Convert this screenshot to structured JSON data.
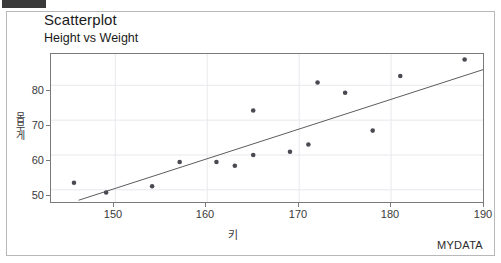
{
  "window": {
    "titlebar_stub": "",
    "footnote": "MYDATA"
  },
  "header": {
    "title": "Scatterplot",
    "subtitle": "Height vs Weight"
  },
  "axes": {
    "x_label": "키",
    "y_label": "몸무게",
    "x_ticks": [
      "150",
      "160",
      "170",
      "180",
      "190"
    ],
    "y_ticks": [
      "50",
      "60",
      "70",
      "80"
    ]
  },
  "colors": {
    "point": "#4a4a52",
    "line": "#5a5a5a",
    "frame": "#7a7a7a",
    "grid": "#e8e8ee",
    "text": "#2b2b2b",
    "panel_border": "#b8b8b8"
  },
  "chart_data": {
    "type": "scatter",
    "title": "Scatterplot",
    "subtitle": "Height vs Weight",
    "xlabel": "키",
    "ylabel": "몸무게",
    "xlim": [
      143,
      190
    ],
    "ylim": [
      46.5,
      89
    ],
    "xticks": [
      150,
      160,
      170,
      180,
      190
    ],
    "yticks": [
      50,
      60,
      70,
      80
    ],
    "grid": true,
    "legend": null,
    "annotations": [
      "MYDATA"
    ],
    "series": [
      {
        "name": "observations",
        "marker": "filled-circle",
        "points": [
          {
            "x": 145.5,
            "y": 52.0
          },
          {
            "x": 149.0,
            "y": 49.2
          },
          {
            "x": 154.0,
            "y": 51.0
          },
          {
            "x": 157.0,
            "y": 58.0
          },
          {
            "x": 161.0,
            "y": 58.0
          },
          {
            "x": 163.0,
            "y": 56.9
          },
          {
            "x": 165.0,
            "y": 60.0
          },
          {
            "x": 165.0,
            "y": 72.8
          },
          {
            "x": 169.0,
            "y": 60.9
          },
          {
            "x": 171.0,
            "y": 63.0
          },
          {
            "x": 172.0,
            "y": 80.8
          },
          {
            "x": 175.0,
            "y": 77.9
          },
          {
            "x": 178.0,
            "y": 67.0
          },
          {
            "x": 181.0,
            "y": 82.7
          },
          {
            "x": 188.0,
            "y": 87.4
          }
        ]
      }
    ],
    "fit_line": {
      "name": "regression-line",
      "x0": 146.0,
      "y0": 47.0,
      "x1": 190.0,
      "y1": 84.5
    }
  }
}
